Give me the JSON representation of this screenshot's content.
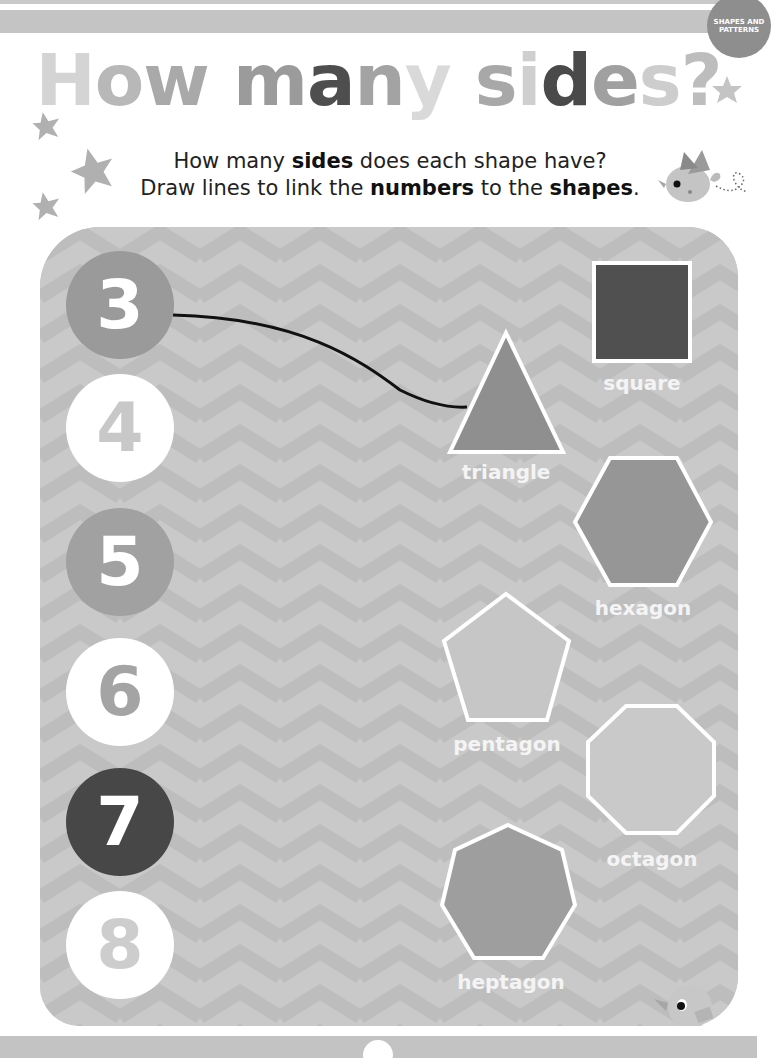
{
  "header": {
    "badge": "SHAPES AND PATTERNS",
    "title_letters": [
      {
        "ch": "H",
        "color": "#d4d4d4"
      },
      {
        "ch": "o",
        "color": "#b8b8b8"
      },
      {
        "ch": "w",
        "color": "#a9a9a9"
      },
      {
        "ch": " ",
        "color": "#ffffff"
      },
      {
        "ch": "m",
        "color": "#9b9b9b"
      },
      {
        "ch": "a",
        "color": "#4e4e4e"
      },
      {
        "ch": "n",
        "color": "#a3a3a3"
      },
      {
        "ch": "y",
        "color": "#d9d9d9"
      },
      {
        "ch": " ",
        "color": "#ffffff"
      },
      {
        "ch": "s",
        "color": "#a8a8a8"
      },
      {
        "ch": "i",
        "color": "#cfcfcf"
      },
      {
        "ch": "d",
        "color": "#4a4a4a"
      },
      {
        "ch": "e",
        "color": "#a0a0a0"
      },
      {
        "ch": "s",
        "color": "#cdcdcd"
      },
      {
        "ch": "?",
        "color": "#bdbdbd"
      }
    ],
    "subtitle_line1": [
      "How many ",
      "sides",
      " does each shape have?"
    ],
    "subtitle_line2": [
      "Draw lines to link the ",
      "numbers",
      " to the ",
      "shapes",
      "."
    ]
  },
  "numbers": [
    {
      "value": "3",
      "bg": "#9a9a9a",
      "fg": "#ffffff",
      "cy": 305
    },
    {
      "value": "4",
      "bg": "#ffffff",
      "fg": "#c8c8c8",
      "cy": 428
    },
    {
      "value": "5",
      "bg": "#a1a1a1",
      "fg": "#ffffff",
      "cy": 562
    },
    {
      "value": "6",
      "bg": "#ffffff",
      "fg": "#a4a4a4",
      "cy": 692
    },
    {
      "value": "7",
      "bg": "#474747",
      "fg": "#ffffff",
      "cy": 822
    },
    {
      "value": "8",
      "bg": "#ffffff",
      "fg": "#cdcdcd",
      "cy": 945
    }
  ],
  "shapes": [
    {
      "name": "square",
      "label": "square",
      "fill": "#505050"
    },
    {
      "name": "triangle",
      "label": "triangle",
      "fill": "#8f8f8f"
    },
    {
      "name": "hexagon",
      "label": "hexagon",
      "fill": "#969696"
    },
    {
      "name": "pentagon",
      "label": "pentagon",
      "fill": "#c6c6c6"
    },
    {
      "name": "octagon",
      "label": "octagon",
      "fill": "#c9c9c9"
    },
    {
      "name": "heptagon",
      "label": "heptagon",
      "fill": "#9e9e9e"
    }
  ],
  "answer_line": {
    "from": "3",
    "to": "triangle"
  }
}
